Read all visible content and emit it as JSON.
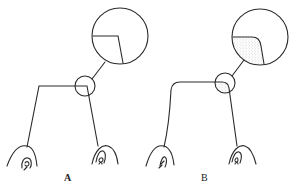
{
  "figure": {
    "panels": [
      {
        "id": "A",
        "label": "A",
        "description": "Sharp-angled junction with magnified inset showing a right-angle corner",
        "corner_style": "sharp",
        "inset_fill": "none"
      },
      {
        "id": "B",
        "label": "B",
        "description": "Rounded junction with magnified inset showing a stippled (filled) rounded corner",
        "corner_style": "rounded",
        "inset_fill": "stippled"
      }
    ],
    "colors": {
      "line": "#2a2a2a",
      "background": "#ffffff",
      "stipple": "#8a8a8a"
    }
  }
}
